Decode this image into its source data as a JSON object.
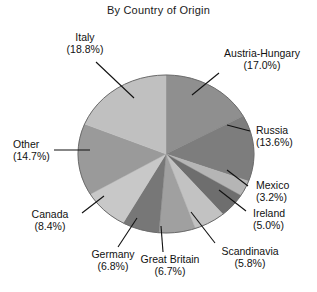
{
  "chart": {
    "title": "By Country of Origin"
  },
  "chart_data": {
    "type": "pie",
    "title": "By Country of Origin",
    "subtitle": "",
    "xlabel": "",
    "ylabel": "",
    "legend_position": "none",
    "labels_position": "outside-with-leader-lines",
    "grid": false,
    "categories": [
      "Austria-Hungary",
      "Russia",
      "Mexico",
      "Ireland",
      "Scandinavia",
      "Great Britain",
      "Germany",
      "Canada",
      "Other",
      "Italy"
    ],
    "values": [
      17.0,
      13.6,
      3.2,
      5.0,
      5.8,
      6.7,
      6.8,
      8.4,
      14.7,
      18.8
    ],
    "value_suffix": "%",
    "total": 100.0,
    "slices": [
      {
        "name": "Austria-Hungary",
        "value": 17.0,
        "label": "Austria-Hungary",
        "percent_text": "(17.0%)",
        "color": "#8f8f8f",
        "start_angle_deg": 0.0,
        "end_angle_deg": 61.2
      },
      {
        "name": "Russia",
        "value": 13.6,
        "label": "Russia",
        "percent_text": "(13.6%)",
        "color": "#7d7d7d",
        "start_angle_deg": 61.2,
        "end_angle_deg": 110.16
      },
      {
        "name": "Mexico",
        "value": 3.2,
        "label": "Mexico",
        "percent_text": "(3.2%)",
        "color": "#b5b5b5",
        "start_angle_deg": 110.16,
        "end_angle_deg": 121.68
      },
      {
        "name": "Ireland",
        "value": 5.0,
        "label": "Ireland",
        "percent_text": "(5.0%)",
        "color": "#6e6e6e",
        "start_angle_deg": 121.68,
        "end_angle_deg": 139.68
      },
      {
        "name": "Scandinavia",
        "value": 5.8,
        "label": "Scandinavia",
        "percent_text": "(5.8%)",
        "color": "#c2c2c2",
        "start_angle_deg": 139.68,
        "end_angle_deg": 160.56
      },
      {
        "name": "Great Britain",
        "value": 6.7,
        "label": "Great Britain",
        "percent_text": "(6.7%)",
        "color": "#a0a0a0",
        "start_angle_deg": 160.56,
        "end_angle_deg": 184.68
      },
      {
        "name": "Germany",
        "value": 6.8,
        "label": "Germany",
        "percent_text": "(6.8%)",
        "color": "#777777",
        "start_angle_deg": 184.68,
        "end_angle_deg": 209.16
      },
      {
        "name": "Canada",
        "value": 8.4,
        "label": "Canada",
        "percent_text": "(8.4%)",
        "color": "#c8c8c8",
        "start_angle_deg": 209.16,
        "end_angle_deg": 239.4
      },
      {
        "name": "Other",
        "value": 14.7,
        "label": "Other",
        "percent_text": "(14.7%)",
        "color": "#9a9a9a",
        "start_angle_deg": 239.4,
        "end_angle_deg": 292.32
      },
      {
        "name": "Italy",
        "value": 18.8,
        "label": "Italy",
        "percent_text": "(18.8%)",
        "color": "#c0c0c0",
        "start_angle_deg": 292.32,
        "end_angle_deg": 360.0
      }
    ]
  },
  "labels": {
    "italy": {
      "name": "Italy",
      "pct": "(18.8%)"
    },
    "austria_hungary": {
      "name": "Austria-Hungary",
      "pct": "(17.0%)"
    },
    "russia": {
      "name": "Russia",
      "pct": "(13.6%)"
    },
    "mexico": {
      "name": "Mexico",
      "pct": "(3.2%)"
    },
    "ireland": {
      "name": "Ireland",
      "pct": "(5.0%)"
    },
    "scandinavia": {
      "name": "Scandinavia",
      "pct": "(5.8%)"
    },
    "great_britain": {
      "name": "Great Britain",
      "pct": "(6.7%)"
    },
    "germany": {
      "name": "Germany",
      "pct": "(6.8%)"
    },
    "canada": {
      "name": "Canada",
      "pct": "(8.4%)"
    },
    "other": {
      "name": "Other",
      "pct": "(14.7%)"
    }
  }
}
